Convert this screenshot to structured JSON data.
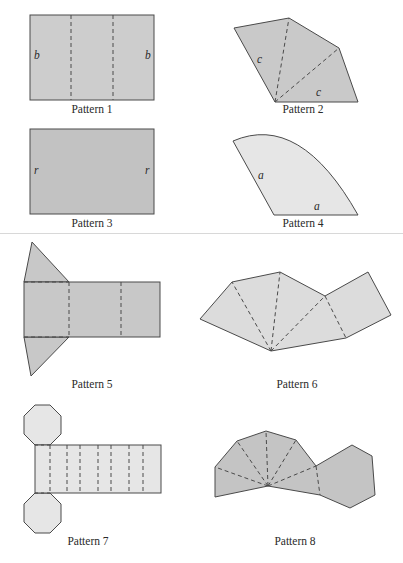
{
  "colors": {
    "fill_medium": "#c8c8c8",
    "fill_light": "#e6e6e6",
    "fill_dark": "#bdbdbd",
    "stroke": "#4a4a4a"
  },
  "patterns": [
    {
      "caption": "Pattern 1",
      "labels": [
        "b",
        "b"
      ]
    },
    {
      "caption": "Pattern 2",
      "labels": [
        "c",
        "c"
      ]
    },
    {
      "caption": "Pattern 3",
      "labels": [
        "r",
        "r"
      ]
    },
    {
      "caption": "Pattern 4",
      "labels": [
        "a",
        "a"
      ]
    },
    {
      "caption": "Pattern 5",
      "labels": []
    },
    {
      "caption": "Pattern 6",
      "labels": []
    },
    {
      "caption": "Pattern 7",
      "labels": []
    },
    {
      "caption": "Pattern 8",
      "labels": []
    }
  ]
}
